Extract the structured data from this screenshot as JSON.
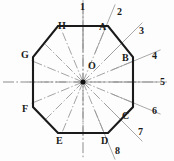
{
  "figure": {
    "shape": "octagon",
    "center_label": "O",
    "stroke_color": "#1a1a1a",
    "centerline_color": "#8c8c8c",
    "background": "#fdfdfd",
    "canvas": {
      "width": 174,
      "height": 161
    },
    "geometry": {
      "center": {
        "cx": 83,
        "cy": 82
      },
      "inner_radius": 50,
      "outer_radius": 54,
      "octagon_points": "58,26 108,26 133,57 133,107 108,133 58,133 33,107 33,57"
    },
    "vertices": [
      {
        "id": "A",
        "label": "A",
        "x": 108,
        "y": 26,
        "lx": 99,
        "ly": 22
      },
      {
        "id": "B",
        "label": "B",
        "x": 133,
        "y": 57,
        "lx": 122,
        "ly": 53
      },
      {
        "id": "C",
        "label": "C",
        "x": 133,
        "y": 107,
        "lx": 122,
        "ly": 111
      },
      {
        "id": "D",
        "label": "D",
        "x": 108,
        "y": 133,
        "lx": 101,
        "ly": 136
      },
      {
        "id": "E",
        "label": "E",
        "x": 58,
        "y": 133,
        "lx": 56,
        "ly": 136
      },
      {
        "id": "F",
        "label": "F",
        "x": 33,
        "y": 107,
        "lx": 22,
        "ly": 104
      },
      {
        "id": "G",
        "label": "G",
        "x": 33,
        "y": 57,
        "lx": 21,
        "ly": 50
      },
      {
        "id": "H",
        "label": "H",
        "x": 58,
        "y": 26,
        "lx": 58,
        "ly": 21
      }
    ],
    "center_point_label": {
      "label": "O",
      "lx": 88,
      "ly": 61
    },
    "rays": [
      {
        "number": "1",
        "angle_deg": -90,
        "lx": 80,
        "ly": 2,
        "length": 84
      },
      {
        "number": "2",
        "angle_deg": -67.5,
        "lx": 117,
        "ly": 7,
        "length": 84
      },
      {
        "number": "3",
        "angle_deg": -45,
        "lx": 139,
        "ly": 26,
        "length": 84
      },
      {
        "number": "4",
        "angle_deg": -22.5,
        "lx": 152,
        "ly": 51,
        "length": 84
      },
      {
        "number": "5",
        "angle_deg": 0,
        "lx": 160,
        "ly": 77,
        "length": 84
      },
      {
        "number": "6",
        "angle_deg": 22.5,
        "lx": 152,
        "ly": 106,
        "length": 84
      },
      {
        "number": "7",
        "angle_deg": 45,
        "lx": 138,
        "ly": 127,
        "length": 84
      },
      {
        "number": "8",
        "angle_deg": 67.5,
        "lx": 115,
        "ly": 146,
        "length": 84
      }
    ],
    "spoke_angles_deg": [
      -90,
      -67.5,
      -45,
      -22.5,
      0,
      22.5,
      45,
      67.5,
      90,
      112.5,
      135,
      157.5,
      180,
      202.5,
      225,
      247.5
    ],
    "axes": {
      "vertical": {
        "x": 83,
        "y1": 3,
        "y2": 158
      },
      "horizontal": {
        "y": 82,
        "x1": 3,
        "x2": 158
      }
    }
  }
}
